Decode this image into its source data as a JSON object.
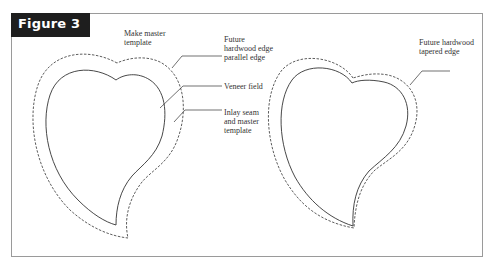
{
  "figure": {
    "title": "Figure 3",
    "colors": {
      "title_bg": "#1e1e1e",
      "title_fg": "#ffffff",
      "line": "#333333",
      "frame": "#9a9a9a"
    }
  },
  "left_diagram": {
    "heading": "Make master\ntemplate",
    "callouts": [
      {
        "text": "Future\nhardwood edge\nparallel edge"
      },
      {
        "text": "Veneer field"
      },
      {
        "text": "Inlay seam\nand master\ntemplate"
      }
    ]
  },
  "right_diagram": {
    "callouts": [
      {
        "text": "Future hardwood\ntapered edge"
      }
    ]
  }
}
